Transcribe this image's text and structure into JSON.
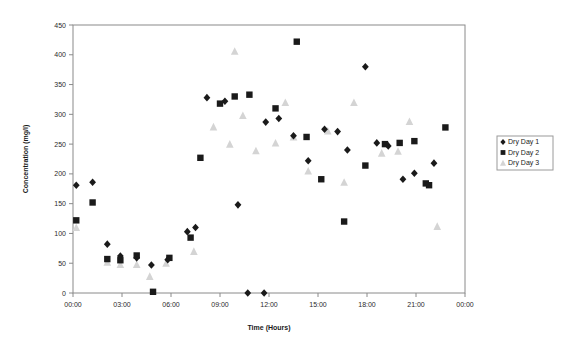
{
  "chart_data": {
    "type": "scatter",
    "title": "",
    "xlabel": "Time (Hours)",
    "ylabel": "Concentration (mg/l)",
    "xlim": [
      0,
      24
    ],
    "ylim": [
      0,
      450
    ],
    "ytick_step": 50,
    "xtick_step": 3,
    "grid": false,
    "legend_position": "right",
    "xticks": [
      "00:00",
      "03:00",
      "06:00",
      "09:00",
      "12:00",
      "15:00",
      "18:00",
      "21:00",
      "00:00"
    ],
    "yticks": [
      "0",
      "50",
      "100",
      "150",
      "200",
      "250",
      "300",
      "350",
      "400",
      "450"
    ],
    "series": [
      {
        "name": "Dry Day 1",
        "marker": "diamond",
        "color": "#1a1a1a",
        "points": [
          [
            0.2,
            181
          ],
          [
            1.2,
            186
          ],
          [
            2.1,
            82
          ],
          [
            2.9,
            62
          ],
          [
            3.9,
            59
          ],
          [
            4.8,
            47
          ],
          [
            5.8,
            56
          ],
          [
            7.0,
            103
          ],
          [
            7.5,
            110
          ],
          [
            8.2,
            328
          ],
          [
            9.3,
            322
          ],
          [
            10.1,
            148
          ],
          [
            10.7,
            0
          ],
          [
            11.7,
            0
          ],
          [
            11.8,
            287
          ],
          [
            12.6,
            293
          ],
          [
            13.5,
            264
          ],
          [
            14.4,
            222
          ],
          [
            15.4,
            275
          ],
          [
            16.2,
            271
          ],
          [
            16.8,
            240
          ],
          [
            17.9,
            380
          ],
          [
            18.6,
            252
          ],
          [
            19.3,
            247
          ],
          [
            20.2,
            191
          ],
          [
            20.9,
            201
          ],
          [
            22.1,
            218
          ]
        ]
      },
      {
        "name": "Dry Day 2",
        "marker": "square",
        "color": "#1a1a1a",
        "points": [
          [
            0.2,
            122
          ],
          [
            1.2,
            152
          ],
          [
            2.1,
            57
          ],
          [
            2.9,
            55
          ],
          [
            3.9,
            63
          ],
          [
            4.9,
            2
          ],
          [
            5.9,
            59
          ],
          [
            7.2,
            93
          ],
          [
            7.8,
            227
          ],
          [
            9.0,
            318
          ],
          [
            9.9,
            330
          ],
          [
            10.8,
            333
          ],
          [
            12.4,
            310
          ],
          [
            13.7,
            422
          ],
          [
            14.3,
            262
          ],
          [
            15.2,
            191
          ],
          [
            16.6,
            120
          ],
          [
            17.9,
            214
          ],
          [
            19.1,
            250
          ],
          [
            20.0,
            252
          ],
          [
            20.9,
            255
          ],
          [
            21.6,
            184
          ],
          [
            21.8,
            181
          ],
          [
            22.8,
            278
          ]
        ]
      },
      {
        "name": "Dry Day 3",
        "marker": "triangle",
        "color": "#d4d4d4",
        "points": [
          [
            0.2,
            110
          ],
          [
            2.1,
            52
          ],
          [
            2.9,
            48
          ],
          [
            3.9,
            48
          ],
          [
            4.7,
            28
          ],
          [
            5.7,
            50
          ],
          [
            7.4,
            70
          ],
          [
            8.6,
            279
          ],
          [
            9.6,
            250
          ],
          [
            9.9,
            406
          ],
          [
            10.4,
            298
          ],
          [
            11.2,
            239
          ],
          [
            12.4,
            252
          ],
          [
            13.0,
            320
          ],
          [
            13.5,
            262
          ],
          [
            14.4,
            205
          ],
          [
            15.6,
            272
          ],
          [
            16.6,
            186
          ],
          [
            17.2,
            320
          ],
          [
            18.9,
            235
          ],
          [
            19.9,
            238
          ],
          [
            20.6,
            288
          ],
          [
            22.3,
            112
          ]
        ]
      }
    ]
  },
  "legend": {
    "items": [
      {
        "label": "Dry Day 1"
      },
      {
        "label": "Dry Day 2"
      },
      {
        "label": "Dry Day 3"
      }
    ]
  }
}
